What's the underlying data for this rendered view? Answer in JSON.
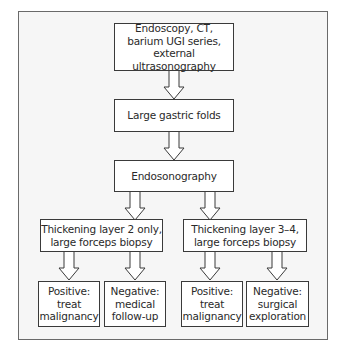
{
  "diagram": {
    "type": "flowchart",
    "nodes": {
      "start": "Endoscopy, CT,\nbarium UGI series,\nexternal ultrasonography",
      "folds": "Large gastric folds",
      "eus": "Endosonography",
      "left_branch": "Thickening layer 2 only,\nlarge forceps biopsy",
      "right_branch": "Thickening layer 3–4,\nlarge forceps biopsy",
      "left_pos": "Positive:\ntreat\nmalignancy",
      "left_neg": "Negative:\nmedical\nfollow-up",
      "right_pos": "Positive:\ntreat\nmalignancy",
      "right_neg": "Negative:\nsurgical\nexploration"
    },
    "edges": [
      [
        "start",
        "folds"
      ],
      [
        "folds",
        "eus"
      ],
      [
        "eus",
        "left_branch"
      ],
      [
        "eus",
        "right_branch"
      ],
      [
        "left_branch",
        "left_pos"
      ],
      [
        "left_branch",
        "left_neg"
      ],
      [
        "right_branch",
        "right_pos"
      ],
      [
        "right_branch",
        "right_neg"
      ]
    ]
  }
}
